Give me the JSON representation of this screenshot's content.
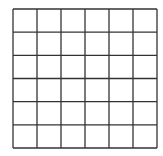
{
  "grid": {
    "rows": 6,
    "cols": 6,
    "x0": 13,
    "y0": 9,
    "x1": 157,
    "y1": 148,
    "line_color": "#333333",
    "background": "#ffffff",
    "line_width": 1.3
  }
}
